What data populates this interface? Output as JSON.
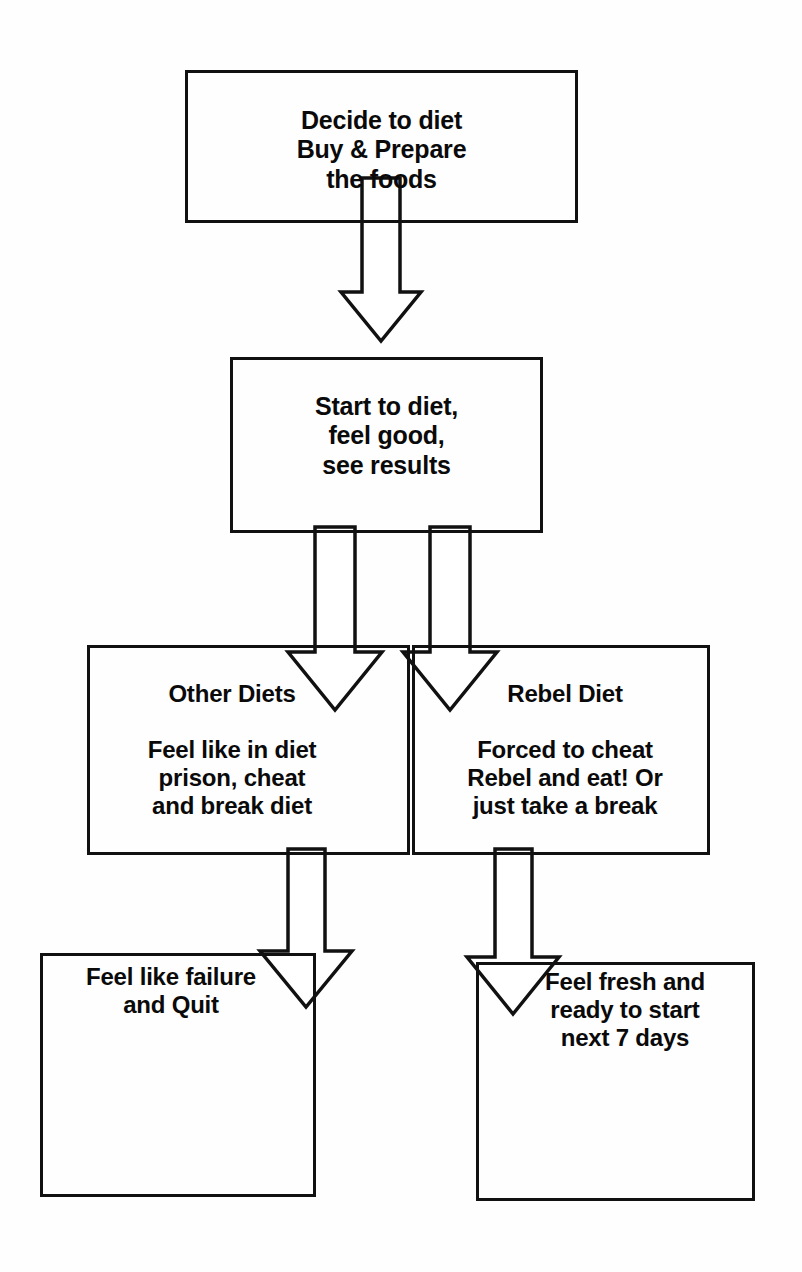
{
  "diagram": {
    "type": "flowchart",
    "orientation": "top-to-bottom",
    "background_color": "#ffffff",
    "line_color": "#111111",
    "text_color": "#0a0a0a",
    "nodes": [
      {
        "id": "decide",
        "heading": "",
        "lines": [
          "Decide to diet",
          "Buy & Prepare",
          "the foods"
        ],
        "text": "Decide to diet\nBuy & Prepare\nthe foods"
      },
      {
        "id": "start",
        "heading": "",
        "lines": [
          "Start to diet,",
          "feel good,",
          "see results"
        ],
        "text": "Start to diet,\nfeel good,\nsee results"
      },
      {
        "id": "other-diets",
        "heading": "Other Diets",
        "lines": [
          "Feel like in diet",
          "prison, cheat",
          "and break diet"
        ],
        "text": "Feel like in diet\nprison, cheat\nand break diet"
      },
      {
        "id": "rebel-diet",
        "heading": "Rebel Diet",
        "lines": [
          "Forced to cheat",
          "Rebel and eat! Or",
          "just take a break"
        ],
        "text": "Forced to cheat\nRebel and eat! Or\njust take a break"
      },
      {
        "id": "failure",
        "heading": "",
        "lines": [
          "Feel like failure",
          "and Quit"
        ],
        "text": "Feel like failure\nand Quit"
      },
      {
        "id": "fresh",
        "heading": "",
        "lines": [
          "Feel fresh and",
          "ready to start",
          "next 7 days"
        ],
        "text": "Feel fresh and\nready to start\nnext 7 days"
      }
    ],
    "edges": [
      {
        "id": "decide-to-start",
        "from": "decide",
        "to": "start",
        "label": "",
        "style": "block-arrow-down"
      },
      {
        "id": "start-to-other",
        "from": "start",
        "to": "other-diets",
        "label": "",
        "style": "block-arrow-down"
      },
      {
        "id": "start-to-rebel",
        "from": "start",
        "to": "rebel-diet",
        "label": "",
        "style": "block-arrow-down"
      },
      {
        "id": "other-to-failure",
        "from": "other-diets",
        "to": "failure",
        "label": "",
        "style": "block-arrow-down"
      },
      {
        "id": "rebel-to-fresh",
        "from": "rebel-diet",
        "to": "fresh",
        "label": "",
        "style": "block-arrow-down"
      }
    ]
  }
}
